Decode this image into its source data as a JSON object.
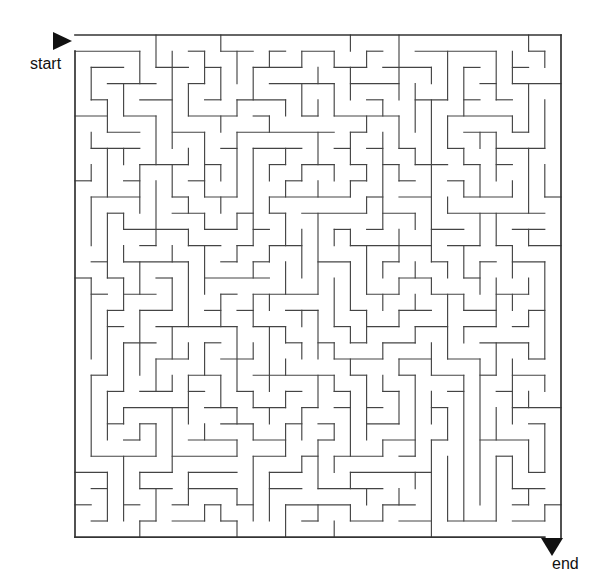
{
  "figure": {
    "kind": "maze-puzzle",
    "background_color": "#ffffff",
    "wall_color": "#444444",
    "border_color": "#333333",
    "marker_color": "#111111",
    "text_color": "#111111"
  },
  "labels": {
    "start": "start",
    "end": "end"
  },
  "markers": {
    "start_icon": "triangle-right-icon",
    "end_icon": "triangle-down-icon"
  },
  "maze": {
    "cols": 30,
    "rows": 31,
    "cell": 16.2,
    "origin_x": 75,
    "origin_y": 35,
    "wall_width": 1.15,
    "border_width": 1.7,
    "entrance": {
      "side": "left",
      "row": 0
    },
    "exit": {
      "side": "bottom",
      "col": 29
    },
    "h_walls": [
      "001111111111111111111111111111",
      "011010010011001001011010100110",
      "100101101100110110100101011001",
      "010110011011001001011010100110",
      "101001100100110110100101011001",
      "010110011011001001011010100110",
      "101001100110110110100101011001",
      "010110011001001001011010100110",
      "101001100110110110100101011001",
      "010110011001001001011010100110",
      "101001100110110110100101011001",
      "010110011001001001011010100110",
      "101001100110110110100101011001",
      "011010010011001001011010100110",
      "100101101100110110100101011001",
      "010110011011001001011010100110",
      "101001100100110110100101011001",
      "010110011011001001011010100110",
      "101001100110110110100101011001",
      "010110011001001001011010100110",
      "101001100110110110100101011001",
      "010110011001001001011010100110",
      "101001100110110110100101011001",
      "011010010011001001011010100110",
      "100101101100110110100101011001",
      "010110011011001001011010100110",
      "101001100100110110100101011001",
      "010110011011001001011010100110",
      "101001100110110110100101011001",
      "010110011001001001011010100110",
      "111111111111111111111111111110"
    ],
    "v_walls": [
      "1001011001011001001100101100101",
      "0110100110100110110011010011010",
      "1010010101001011001101001101001",
      "0101101010110100110010110010110",
      "1001011001011001001100101100101",
      "0110100110100110110011010011010",
      "1010010101001011001101001101001",
      "0101101010110100110010110010110",
      "1001011001011001001100101100101",
      "0110100110100110110011010011010",
      "1010010101001011001101001101001",
      "0101101010110100110010110010110",
      "1001011001011001001100101100101",
      "0110100110100110110011010011010",
      "1010010101001011001101001101001",
      "0101101010110100110010110010110",
      "1001011001011001001100101100101",
      "0110100110100110110011010011010",
      "1010010101001011001101001101001",
      "0101101010110100110010110010110",
      "1001011001011001001100101100101",
      "0110100110100110110011010011010",
      "1010010101001011001101001101001",
      "0101101010110100110010110010110",
      "1001011001011001001100101100101",
      "0110100110100110110011010011010",
      "1010010101001011001101001101001",
      "0101101010110100110010110010110",
      "1001011001011001001100101100101",
      "0110100110100110110011010011010",
      "1111111111111111111111111111111"
    ]
  }
}
